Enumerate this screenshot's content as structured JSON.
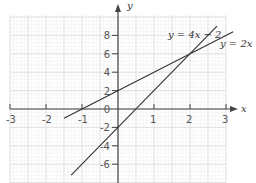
{
  "chart_data": {
    "type": "line",
    "title": "",
    "xlabel": "x",
    "ylabel": "y",
    "xlim": [
      -3,
      3.3
    ],
    "ylim": [
      -7.5,
      9.5
    ],
    "grid": true,
    "x_ticks": [
      -3,
      -2,
      -1,
      1,
      2,
      3
    ],
    "x_tick_labels": [
      "-3",
      "-2",
      "-1",
      "1",
      "2",
      "3"
    ],
    "y_ticks": [
      8,
      6,
      4,
      2,
      0,
      -2,
      -4,
      -6
    ],
    "y_tick_labels": [
      "8",
      "6",
      "4",
      "2",
      "0",
      "-2",
      "-4",
      "-6"
    ],
    "series": [
      {
        "name": "y = 4x − 2",
        "equation": "y = 4x - 2",
        "slope": 4,
        "intercept": -2,
        "x_range": [
          -1.3,
          2.75
        ]
      },
      {
        "name": "y = 2x + 2",
        "equation": "y = 2x + 2",
        "slope": 2,
        "intercept": 2,
        "x_range": [
          -1.5,
          3.2
        ]
      }
    ],
    "annotations": [
      {
        "text": "y = 4x − 2",
        "at": [
          1.2,
          8.2
        ]
      },
      {
        "text": "y = 2x + 2",
        "at": [
          3.1,
          6.6
        ]
      }
    ],
    "intersection": [
      2,
      6
    ]
  },
  "labels": {
    "x_axis": "x",
    "y_axis": "y",
    "line1": "y = 4x − 2",
    "line2": "y = 2x + 2"
  },
  "colors": {
    "grid_minor": "#eeeeee",
    "grid_major": "#d9d9d9",
    "axis": "#444444",
    "line": "#333333",
    "text": "#555555"
  }
}
